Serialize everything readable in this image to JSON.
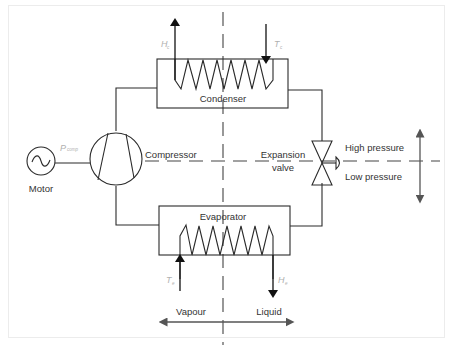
{
  "diagram": {
    "components": {
      "condenser": "Condenser",
      "evaporator": "Evaporator",
      "compressor": "Compressor",
      "expansion_valve_line1": "Expansion",
      "expansion_valve_line2": "valve",
      "motor": "Motor"
    },
    "symbols": {
      "heat_condenser": {
        "main": "H",
        "sub": "c"
      },
      "temp_condenser": {
        "main": "T",
        "sub": "c"
      },
      "power_compressor": {
        "main": "P",
        "sub": "comp"
      },
      "temp_evaporator": {
        "main": "T",
        "sub": "e"
      },
      "heat_evaporator": {
        "main": "H",
        "sub": "e"
      }
    },
    "regions": {
      "high_pressure": "High pressure",
      "low_pressure": "Low pressure",
      "vapour": "Vapour",
      "liquid": "Liquid"
    },
    "colors": {
      "line": "#2a2a2a",
      "symbol_text": "#b0b0b0",
      "label_text": "#333333",
      "frame": "#ececec"
    }
  }
}
